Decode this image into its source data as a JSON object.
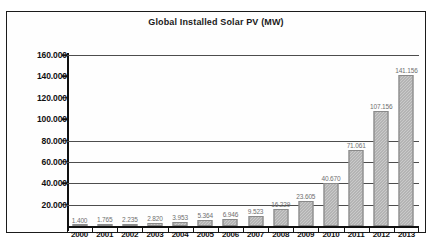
{
  "chart_data": {
    "type": "bar",
    "title": "Global Installed Solar PV (MW)",
    "xlabel": "",
    "ylabel": "",
    "categories": [
      "2000",
      "2001",
      "2002",
      "2003",
      "2004",
      "2005",
      "2006",
      "2007",
      "2008",
      "2009",
      "2010",
      "2011",
      "2012",
      "2013"
    ],
    "values": [
      1400,
      1765,
      2235,
      2820,
      3953,
      5364,
      6946,
      9523,
      16229,
      23605,
      40670,
      71061,
      107156,
      141156
    ],
    "value_labels": [
      "1.400",
      "1.765",
      "2.235",
      "2.820",
      "3.953",
      "5.364",
      "6.946",
      "9.523",
      "16.229",
      "23.605",
      "40.670",
      "71.061",
      "107.156",
      "141.156"
    ],
    "ylim": [
      0,
      160000
    ],
    "y_ticks": [
      160000,
      140000,
      120000,
      100000,
      80000,
      60000,
      40000,
      20000
    ],
    "y_tick_labels": [
      "160.000",
      "140.000",
      "120.000",
      "100.000",
      "80.000",
      "60.000",
      "40.000",
      "20.000"
    ],
    "gridlines_at": [
      160000,
      80000,
      60000,
      40000,
      20000
    ],
    "grid": true,
    "legend": "none",
    "bar_color": "#9e9e9e",
    "axis_color": "#111111"
  }
}
